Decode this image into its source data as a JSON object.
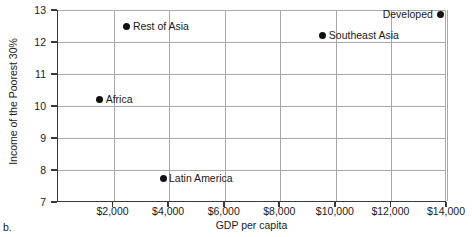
{
  "figure": {
    "panel_caption": "b."
  },
  "chart_data": {
    "type": "scatter",
    "title": "",
    "xlabel": "GDP per capita",
    "ylabel": "Income of the Poorest 30%",
    "xlim": [
      0,
      14000
    ],
    "ylim": [
      7,
      13
    ],
    "grid": true,
    "legend": "none (points labeled inline)",
    "xticks": [
      {
        "value": 2000,
        "label": "$2,000"
      },
      {
        "value": 4000,
        "label": "$4,000"
      },
      {
        "value": 6000,
        "label": "$6,000"
      },
      {
        "value": 8000,
        "label": "$8,000"
      },
      {
        "value": 10000,
        "label": "$10,000"
      },
      {
        "value": 12000,
        "label": "$12,000"
      },
      {
        "value": 14000,
        "label": "$14,000"
      }
    ],
    "yticks": [
      {
        "value": 7,
        "label": "7"
      },
      {
        "value": 8,
        "label": "8"
      },
      {
        "value": 9,
        "label": "9"
      },
      {
        "value": 10,
        "label": "10"
      },
      {
        "value": 11,
        "label": "11"
      },
      {
        "value": 12,
        "label": "12"
      },
      {
        "value": 13,
        "label": "13"
      }
    ],
    "marker_color": "#111111",
    "points": [
      {
        "name": "Africa",
        "x": 1500,
        "y": 10.2,
        "label": "Africa",
        "label_side": "right"
      },
      {
        "name": "Rest of Asia",
        "x": 2480,
        "y": 12.5,
        "label": "Rest of Asia",
        "label_side": "right"
      },
      {
        "name": "Latin America",
        "x": 3780,
        "y": 7.75,
        "label": "Latin America",
        "label_side": "right"
      },
      {
        "name": "Southeast Asia",
        "x": 9530,
        "y": 12.2,
        "label": "Southeast Asia",
        "label_side": "right"
      },
      {
        "name": "Developed",
        "x": 13780,
        "y": 12.85,
        "label": "Developed",
        "label_side": "left"
      }
    ]
  }
}
